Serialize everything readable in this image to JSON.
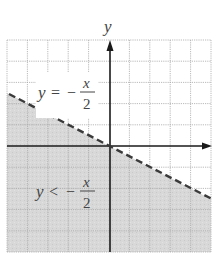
{
  "figure": {
    "axis_label_y": "y",
    "axis_label_x": "x",
    "boundary_label": {
      "lhs": "y",
      "relation": "=",
      "sign": "−",
      "numerator": "x",
      "denominator": "2"
    },
    "region_label": {
      "lhs": "y",
      "relation": "<",
      "sign": "−",
      "numerator": "x",
      "denominator": "2"
    },
    "grid": {
      "x_min": -5,
      "x_max": 5,
      "y_min": -5,
      "y_max": 5,
      "step": 1
    },
    "boundary_line": {
      "equation": "y = -x/2",
      "style": "dashed"
    },
    "shaded_region": "below boundary line",
    "colors": {
      "shade": "#d6d6d6",
      "grid": "#a8a8a8",
      "axis": "#1a1a1a",
      "boundary": "#3a3a3a",
      "text": "#444444"
    }
  }
}
